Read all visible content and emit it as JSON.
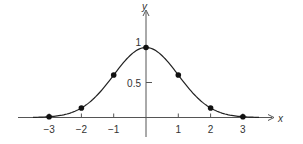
{
  "chart_data": {
    "type": "line",
    "title": "",
    "xlabel": "x",
    "ylabel": "y",
    "x": [
      -3,
      -2,
      -1,
      0,
      1,
      2,
      3
    ],
    "series": [
      {
        "name": "y = e^(-x^2/2)",
        "values": [
          0.011,
          0.135,
          0.607,
          1.0,
          0.607,
          0.135,
          0.011
        ],
        "markers": true
      }
    ],
    "x_ticks": [
      "-3",
      "-2",
      "-1",
      "1",
      "2",
      "3"
    ],
    "y_ticks": [
      "0.5",
      "1"
    ],
    "xlim": [
      -3.5,
      3.5
    ],
    "ylim": [
      0,
      1.3
    ],
    "grid": false,
    "legend": "none",
    "curve_color": "#222222"
  }
}
